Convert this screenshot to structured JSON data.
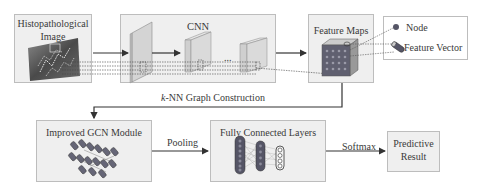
{
  "diagram": {
    "nodes": {
      "histo": {
        "title_line1": "Histopathological",
        "title_line2": "Image"
      },
      "cnn": {
        "title": "CNN",
        "ellipsis": "..."
      },
      "feature_maps": {
        "title": "Feature Maps"
      },
      "legend": {
        "node_label": "Node",
        "feature_vector_label": "Feature Vector"
      },
      "gcn": {
        "title": "Improved GCN Module"
      },
      "fc": {
        "title": "Fully Connected Layers"
      },
      "predict": {
        "title_line1": "Predictive",
        "title_line2": "Result"
      }
    },
    "edges": {
      "knn": {
        "label_italic": "k",
        "label_rest": "-NN Graph Construction"
      },
      "pooling": {
        "label": "Pooling"
      },
      "softmax": {
        "label": "Softmax"
      }
    },
    "colors": {
      "box_fill": "#efefef",
      "box_border": "#bdbdbd",
      "arrow": "#333333",
      "node_fill": "#555566",
      "cube_face": "#d8d8d8"
    }
  }
}
